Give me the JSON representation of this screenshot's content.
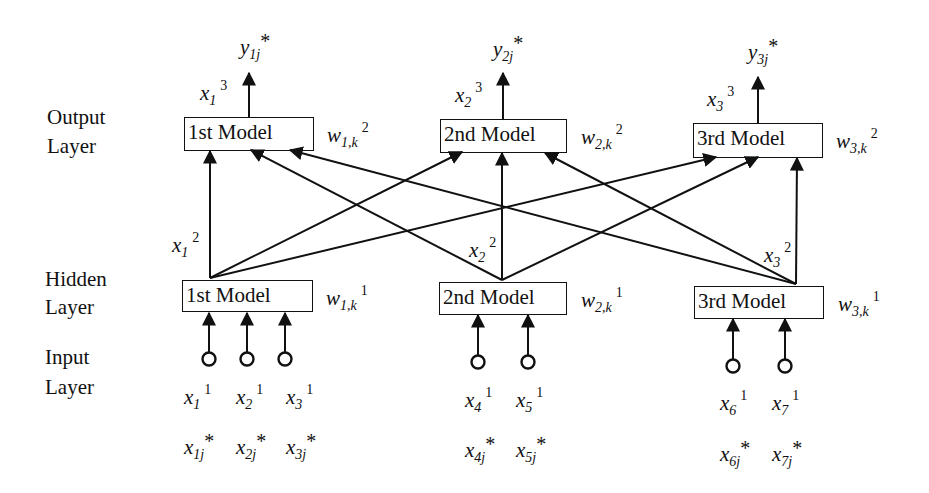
{
  "diagram": {
    "type": "layered-network",
    "layers": [
      {
        "id": "output",
        "label_line1": "Output",
        "label_line2": "Layer"
      },
      {
        "id": "hidden",
        "label_line1": "Hidden",
        "label_line2": "Layer"
      },
      {
        "id": "input",
        "label_line1": "Input",
        "label_line2": "Layer"
      }
    ],
    "output_models": [
      {
        "label": "1st Model",
        "weight": {
          "base": "w",
          "sub": "1,k",
          "sup": "2"
        },
        "out_var": {
          "base": "x",
          "sub": "1",
          "sup": "3"
        },
        "target": {
          "base": "y",
          "sub": "1j",
          "star": "*"
        }
      },
      {
        "label": "2nd Model",
        "weight": {
          "base": "w",
          "sub": "2,k",
          "sup": "2"
        },
        "out_var": {
          "base": "x",
          "sub": "2",
          "sup": "3"
        },
        "target": {
          "base": "y",
          "sub": "2j",
          "star": "*"
        }
      },
      {
        "label": "3rd Model",
        "weight": {
          "base": "w",
          "sub": "3,k",
          "sup": "2"
        },
        "out_var": {
          "base": "x",
          "sub": "3",
          "sup": "3"
        },
        "target": {
          "base": "y",
          "sub": "3j",
          "star": "*"
        }
      }
    ],
    "hidden_models": [
      {
        "label": "1st Model",
        "weight": {
          "base": "w",
          "sub": "1,k",
          "sup": "1"
        },
        "out_var": {
          "base": "x",
          "sub": "1",
          "sup": "2"
        }
      },
      {
        "label": "2nd Model",
        "weight": {
          "base": "w",
          "sub": "2,k",
          "sup": "1"
        },
        "out_var": {
          "base": "x",
          "sub": "2",
          "sup": "2"
        }
      },
      {
        "label": "3rd Model",
        "weight": {
          "base": "w",
          "sub": "3,k",
          "sup": "1"
        },
        "out_var": {
          "base": "x",
          "sub": "3",
          "sup": "2"
        }
      }
    ],
    "inputs": [
      {
        "var": {
          "base": "x",
          "sub": "1",
          "sup": "1"
        },
        "raw": {
          "base": "x",
          "sub": "1j",
          "star": "*"
        },
        "feeds": "hidden.1st Model"
      },
      {
        "var": {
          "base": "x",
          "sub": "2",
          "sup": "1"
        },
        "raw": {
          "base": "x",
          "sub": "2j",
          "star": "*"
        },
        "feeds": "hidden.1st Model"
      },
      {
        "var": {
          "base": "x",
          "sub": "3",
          "sup": "1"
        },
        "raw": {
          "base": "x",
          "sub": "3j",
          "star": "*"
        },
        "feeds": "hidden.1st Model"
      },
      {
        "var": {
          "base": "x",
          "sub": "4",
          "sup": "1"
        },
        "raw": {
          "base": "x",
          "sub": "4j",
          "star": "*"
        },
        "feeds": "hidden.2nd Model"
      },
      {
        "var": {
          "base": "x",
          "sub": "5",
          "sup": "1"
        },
        "raw": {
          "base": "x",
          "sub": "5j",
          "star": "*"
        },
        "feeds": "hidden.2nd Model"
      },
      {
        "var": {
          "base": "x",
          "sub": "6",
          "sup": "1"
        },
        "raw": {
          "base": "x",
          "sub": "6j",
          "star": "*"
        },
        "feeds": "hidden.3rd Model"
      },
      {
        "var": {
          "base": "x",
          "sub": "7",
          "sup": "1"
        },
        "raw": {
          "base": "x",
          "sub": "7j",
          "star": "*"
        },
        "feeds": "hidden.3rd Model"
      }
    ],
    "connections": "every hidden model feeds every output model (fully connected)",
    "stroke_color": "#111111",
    "background": "#ffffff"
  }
}
